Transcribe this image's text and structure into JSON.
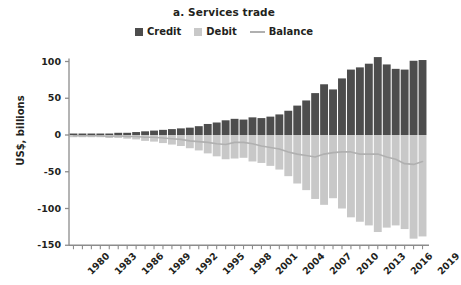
{
  "chart_data": {
    "type": "bar",
    "title": "a. Services trade",
    "subtitle": "",
    "xlabel": "",
    "ylabel": "US$, billions",
    "ylim": [
      -150,
      125
    ],
    "yticks": [
      100,
      50,
      0,
      -50,
      -100,
      -150
    ],
    "ytick_labels": [
      "100",
      "50",
      "0",
      "-50",
      "-100",
      "-150"
    ],
    "grid": false,
    "legend_position": "top-center",
    "x": [
      1980,
      1981,
      1982,
      1983,
      1984,
      1985,
      1986,
      1987,
      1988,
      1989,
      1990,
      1991,
      1992,
      1993,
      1994,
      1995,
      1996,
      1997,
      1998,
      1999,
      2000,
      2001,
      2002,
      2003,
      2004,
      2005,
      2006,
      2007,
      2008,
      2009,
      2010,
      2011,
      2012,
      2013,
      2014,
      2015,
      2016,
      2017,
      2018,
      2019
    ],
    "xtick_labels": [
      "1980",
      "1983",
      "1986",
      "1989",
      "1992",
      "1995",
      "1998",
      "2001",
      "2004",
      "2007",
      "2010",
      "2013",
      "2016",
      "2019"
    ],
    "xtick_values": [
      1980,
      1983,
      1986,
      1989,
      1992,
      1995,
      1998,
      2001,
      2004,
      2007,
      2010,
      2013,
      2016,
      2019
    ],
    "series": [
      {
        "name": "Credit",
        "type": "bar",
        "color": "#4d4d4d",
        "values": [
          2,
          2,
          2,
          2,
          2,
          3,
          3,
          4,
          5,
          6,
          7,
          8,
          9,
          10,
          12,
          15,
          17,
          20,
          22,
          21,
          24,
          23,
          25,
          28,
          33,
          40,
          47,
          57,
          69,
          62,
          77,
          89,
          92,
          97,
          106,
          96,
          90,
          89,
          101,
          102
        ]
      },
      {
        "name": "Debit",
        "type": "bar",
        "color": "#c8c8c8",
        "values": [
          -3,
          -3,
          -3,
          -3,
          -4,
          -4,
          -5,
          -6,
          -8,
          -9,
          -11,
          -13,
          -15,
          -18,
          -21,
          -25,
          -29,
          -33,
          -32,
          -31,
          -36,
          -38,
          -42,
          -47,
          -56,
          -66,
          -75,
          -87,
          -95,
          -86,
          -100,
          -112,
          -118,
          -123,
          -132,
          -126,
          -123,
          -128,
          -141,
          -138
        ]
      },
      {
        "name": "Balance",
        "type": "line",
        "color": "#b0b0b0",
        "values": [
          -1,
          -1,
          -1,
          -1,
          -2,
          -1,
          -2,
          -2,
          -3,
          -3,
          -4,
          -5,
          -6,
          -8,
          -9,
          -10,
          -12,
          -13,
          -10,
          -10,
          -12,
          -15,
          -17,
          -19,
          -23,
          -26,
          -28,
          -30,
          -26,
          -24,
          -23,
          -23,
          -26,
          -26,
          -26,
          -30,
          -33,
          -39,
          -40,
          -36
        ]
      }
    ]
  },
  "legend": {
    "items": [
      {
        "label": "Credit",
        "marker": "square",
        "color": "#4d4d4d"
      },
      {
        "label": "Debit",
        "marker": "square",
        "color": "#c8c8c8"
      },
      {
        "label": "Balance",
        "marker": "line",
        "color": "#b0b0b0"
      }
    ]
  },
  "axis": {
    "color": "#8c8c8c"
  }
}
